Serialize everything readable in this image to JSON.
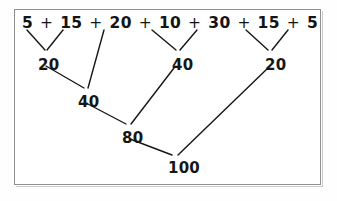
{
  "diagram": {
    "frame_color": "#8f8f8f",
    "ink_color": "#161616",
    "background_color": "#ffffff",
    "expression": {
      "terms": [
        "5",
        "15",
        "20",
        "10",
        "30",
        "15",
        "5"
      ],
      "operator": "+",
      "full_text": "5 + 15 + 20 + 10 + 30 + 15 + 5"
    },
    "levels": [
      {
        "level": 1,
        "nodes": [
          {
            "value": "20",
            "x": 38,
            "y": 58
          },
          {
            "value": "40",
            "x": 172,
            "y": 58
          },
          {
            "value": "20",
            "x": 265,
            "y": 58
          }
        ]
      },
      {
        "level": 2,
        "nodes": [
          {
            "value": "40",
            "x": 78,
            "y": 95
          }
        ]
      },
      {
        "level": 3,
        "nodes": [
          {
            "value": "80",
            "x": 122,
            "y": 131
          }
        ]
      },
      {
        "level": 4,
        "nodes": [
          {
            "value": "100",
            "x": 168,
            "y": 161
          }
        ]
      }
    ],
    "edges": [
      {
        "from": "term-5a",
        "to": "sum-20a",
        "x1": 27,
        "y1": 30,
        "x2": 45,
        "y2": 50
      },
      {
        "from": "term-15a",
        "to": "sum-20a",
        "x1": 63,
        "y1": 30,
        "x2": 47,
        "y2": 50
      },
      {
        "from": "term-20",
        "to": "sum-40a",
        "x1": 104,
        "y1": 30,
        "x2": 88,
        "y2": 88
      },
      {
        "from": "term-10",
        "to": "sum-40b",
        "x1": 152,
        "y1": 30,
        "x2": 176,
        "y2": 50
      },
      {
        "from": "term-30",
        "to": "sum-40b",
        "x1": 197,
        "y1": 30,
        "x2": 180,
        "y2": 50
      },
      {
        "from": "term-15b",
        "to": "sum-20b",
        "x1": 246,
        "y1": 30,
        "x2": 268,
        "y2": 50
      },
      {
        "from": "term-5b",
        "to": "sum-20b",
        "x1": 288,
        "y1": 30,
        "x2": 272,
        "y2": 50
      },
      {
        "from": "sum-20a",
        "to": "sum-40a",
        "x1": 46,
        "y1": 66,
        "x2": 84,
        "y2": 88
      },
      {
        "from": "sum-40b",
        "to": "sum-80",
        "x1": 174,
        "y1": 68,
        "x2": 131,
        "y2": 124
      },
      {
        "from": "sum-40a",
        "to": "sum-80",
        "x1": 86,
        "y1": 103,
        "x2": 126,
        "y2": 124
      },
      {
        "from": "sum-20b",
        "to": "sum-100",
        "x1": 268,
        "y1": 68,
        "x2": 178,
        "y2": 155
      },
      {
        "from": "sum-80",
        "to": "sum-100",
        "x1": 130,
        "y1": 139,
        "x2": 172,
        "y2": 155
      }
    ]
  }
}
